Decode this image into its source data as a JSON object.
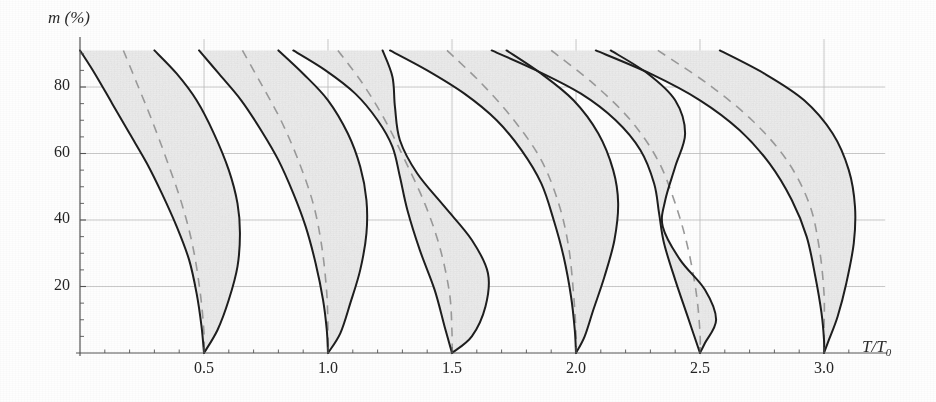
{
  "figure": {
    "caption_y": "m (%)",
    "caption_x": "T/T₀",
    "background": "#fefefe"
  },
  "chart_data": {
    "type": "line",
    "title": "",
    "xlabel": "T/T₀",
    "ylabel": "m (%)",
    "xlim": [
      0,
      3.15
    ],
    "ylim": [
      0,
      92
    ],
    "grid": true,
    "legend": "none",
    "style": {
      "curve_color": "#1e1e1e",
      "curve_width": 2.0,
      "dashed_color": "#9a9a9a",
      "dashed_width": 1.6,
      "fill_color": "#ececec",
      "grid_color": "#b9b9b9",
      "axis_color": "#555555"
    },
    "x_ticks_major": [
      0.5,
      1.0,
      1.5,
      2.0,
      2.5,
      3.0
    ],
    "x_tick_labels": [
      "0.5",
      "1.0",
      "1.5",
      "2.0",
      "2.5",
      "3.0"
    ],
    "x_minor_step": 0.1,
    "y_ticks_major": [
      20,
      40,
      60,
      80
    ],
    "y_tick_labels": [
      "20",
      "40",
      "60",
      "80"
    ],
    "y_minor_step": 5,
    "lobes": [
      {
        "index": 1,
        "apex_x": 0.5,
        "apex_y": 0,
        "top_y": 91,
        "left_top_x": 0.0,
        "right_top_x": 0.3,
        "widest_x": 0.64,
        "widest_y": 42,
        "left_boundary": [
          [
            0.0,
            91
          ],
          [
            0.06,
            84
          ],
          [
            0.13,
            75
          ],
          [
            0.2,
            66
          ],
          [
            0.27,
            57
          ],
          [
            0.33,
            48
          ],
          [
            0.39,
            38
          ],
          [
            0.44,
            28
          ],
          [
            0.47,
            18
          ],
          [
            0.49,
            8
          ],
          [
            0.5,
            0
          ]
        ],
        "right_boundary": [
          [
            0.3,
            91
          ],
          [
            0.39,
            84
          ],
          [
            0.47,
            76
          ],
          [
            0.54,
            66
          ],
          [
            0.6,
            55
          ],
          [
            0.635,
            45
          ],
          [
            0.645,
            36
          ],
          [
            0.635,
            26
          ],
          [
            0.6,
            16
          ],
          [
            0.555,
            7
          ],
          [
            0.5,
            0
          ]
        ],
        "dashed": [
          [
            0.175,
            91
          ],
          [
            0.23,
            81
          ],
          [
            0.29,
            70
          ],
          [
            0.35,
            58
          ],
          [
            0.41,
            45
          ],
          [
            0.455,
            32
          ],
          [
            0.485,
            18
          ],
          [
            0.5,
            6
          ],
          [
            0.5,
            0
          ]
        ]
      },
      {
        "index": 2,
        "apex_x": 1.0,
        "apex_y": 0,
        "top_y": 91,
        "left_top_x": 0.48,
        "right_top_x": 0.8,
        "widest_x": 1.14,
        "widest_y": 48,
        "left_boundary": [
          [
            0.48,
            91
          ],
          [
            0.56,
            84
          ],
          [
            0.65,
            76
          ],
          [
            0.73,
            67
          ],
          [
            0.8,
            58
          ],
          [
            0.86,
            48
          ],
          [
            0.91,
            38
          ],
          [
            0.95,
            27
          ],
          [
            0.98,
            16
          ],
          [
            0.995,
            7
          ],
          [
            1.0,
            0
          ]
        ],
        "right_boundary": [
          [
            0.8,
            91
          ],
          [
            0.9,
            84
          ],
          [
            1.0,
            76
          ],
          [
            1.08,
            66
          ],
          [
            1.13,
            56
          ],
          [
            1.155,
            46
          ],
          [
            1.155,
            36
          ],
          [
            1.13,
            25
          ],
          [
            1.09,
            15
          ],
          [
            1.05,
            6
          ],
          [
            1.0,
            0
          ]
        ],
        "dashed": [
          [
            0.655,
            91
          ],
          [
            0.73,
            81
          ],
          [
            0.81,
            70
          ],
          [
            0.88,
            58
          ],
          [
            0.94,
            45
          ],
          [
            0.975,
            32
          ],
          [
            0.995,
            18
          ],
          [
            1.0,
            6
          ],
          [
            1.0,
            0
          ]
        ]
      },
      {
        "index": 3,
        "apex_x": 1.5,
        "apex_y": 0,
        "top_y": 91,
        "left_top_x": 0.86,
        "right_top_x": 1.22,
        "crossing_x": 1.27,
        "crossing_y": 58,
        "widest_x": 1.64,
        "widest_y": 40,
        "left_boundary": [
          [
            0.86,
            91
          ],
          [
            0.99,
            85
          ],
          [
            1.11,
            78
          ],
          [
            1.2,
            70
          ],
          [
            1.26,
            62
          ],
          [
            1.29,
            53
          ],
          [
            1.32,
            43
          ],
          [
            1.37,
            31
          ],
          [
            1.43,
            19
          ],
          [
            1.47,
            8
          ],
          [
            1.5,
            0
          ]
        ],
        "right_boundary": [
          [
            1.22,
            91
          ],
          [
            1.26,
            83
          ],
          [
            1.27,
            74
          ],
          [
            1.29,
            64
          ],
          [
            1.36,
            54
          ],
          [
            1.47,
            44
          ],
          [
            1.58,
            34
          ],
          [
            1.645,
            24
          ],
          [
            1.635,
            14
          ],
          [
            1.58,
            5
          ],
          [
            1.5,
            0
          ]
        ],
        "dashed": [
          [
            1.04,
            91
          ],
          [
            1.14,
            81
          ],
          [
            1.23,
            70
          ],
          [
            1.31,
            58
          ],
          [
            1.39,
            45
          ],
          [
            1.45,
            32
          ],
          [
            1.49,
            18
          ],
          [
            1.5,
            6
          ],
          [
            1.5,
            0
          ]
        ]
      },
      {
        "index": 4,
        "apex_x": 2.0,
        "apex_y": 0,
        "top_y": 91,
        "left_top_x": 1.25,
        "right_top_x": 1.72,
        "widest_x": 2.16,
        "widest_y": 45,
        "left_boundary": [
          [
            1.25,
            91
          ],
          [
            1.4,
            85
          ],
          [
            1.55,
            78
          ],
          [
            1.68,
            70
          ],
          [
            1.78,
            61
          ],
          [
            1.86,
            51
          ],
          [
            1.91,
            40
          ],
          [
            1.95,
            29
          ],
          [
            1.98,
            17
          ],
          [
            1.995,
            7
          ],
          [
            2.0,
            0
          ]
        ],
        "right_boundary": [
          [
            1.72,
            91
          ],
          [
            1.86,
            84
          ],
          [
            1.99,
            76
          ],
          [
            2.09,
            66
          ],
          [
            2.15,
            55
          ],
          [
            2.17,
            45
          ],
          [
            2.155,
            34
          ],
          [
            2.115,
            23
          ],
          [
            2.07,
            13
          ],
          [
            2.035,
            5
          ],
          [
            2.0,
            0
          ]
        ],
        "dashed": [
          [
            1.48,
            91
          ],
          [
            1.62,
            81
          ],
          [
            1.75,
            70
          ],
          [
            1.86,
            58
          ],
          [
            1.93,
            45
          ],
          [
            1.97,
            32
          ],
          [
            1.99,
            18
          ],
          [
            2.0,
            6
          ],
          [
            2.0,
            0
          ]
        ]
      },
      {
        "index": 5,
        "apex_x": 2.5,
        "apex_y": 0,
        "top_y": 91,
        "left_top_x": 1.66,
        "right_top_x": 2.14,
        "crossing_x": 2.335,
        "crossing_y": 39,
        "widest_x": 2.62,
        "widest_y": 22,
        "left_boundary": [
          [
            1.66,
            91
          ],
          [
            1.84,
            85
          ],
          [
            2.02,
            78
          ],
          [
            2.16,
            70
          ],
          [
            2.26,
            61
          ],
          [
            2.315,
            51
          ],
          [
            2.335,
            42
          ],
          [
            2.355,
            33
          ],
          [
            2.4,
            22
          ],
          [
            2.45,
            11
          ],
          [
            2.5,
            0
          ]
        ],
        "right_boundary": [
          [
            2.14,
            91
          ],
          [
            2.29,
            84
          ],
          [
            2.4,
            76
          ],
          [
            2.44,
            66
          ],
          [
            2.4,
            56
          ],
          [
            2.36,
            46
          ],
          [
            2.35,
            38
          ],
          [
            2.42,
            28
          ],
          [
            2.52,
            19
          ],
          [
            2.565,
            10
          ],
          [
            2.52,
            3
          ],
          [
            2.5,
            0
          ]
        ],
        "dashed": [
          [
            1.9,
            91
          ],
          [
            2.07,
            81
          ],
          [
            2.22,
            70
          ],
          [
            2.33,
            58
          ],
          [
            2.4,
            45
          ],
          [
            2.45,
            32
          ],
          [
            2.485,
            18
          ],
          [
            2.5,
            6
          ],
          [
            2.5,
            0
          ]
        ]
      },
      {
        "index": 6,
        "apex_x": 3.0,
        "apex_y": 0,
        "top_y": 91,
        "left_top_x": 2.08,
        "right_top_x": 2.58,
        "widest_x": 3.12,
        "widest_y": 28,
        "left_boundary": [
          [
            2.08,
            91
          ],
          [
            2.3,
            84
          ],
          [
            2.5,
            76
          ],
          [
            2.66,
            67
          ],
          [
            2.78,
            57
          ],
          [
            2.87,
            46
          ],
          [
            2.93,
            35
          ],
          [
            2.965,
            23
          ],
          [
            2.99,
            12
          ],
          [
            3.0,
            4
          ],
          [
            3.0,
            0
          ]
        ],
        "right_boundary": [
          [
            2.58,
            91
          ],
          [
            2.76,
            84
          ],
          [
            2.92,
            76
          ],
          [
            3.035,
            66
          ],
          [
            3.1,
            55
          ],
          [
            3.125,
            44
          ],
          [
            3.12,
            33
          ],
          [
            3.09,
            21
          ],
          [
            3.055,
            11
          ],
          [
            3.02,
            4
          ],
          [
            3.0,
            0
          ]
        ],
        "dashed": [
          [
            2.33,
            91
          ],
          [
            2.53,
            81
          ],
          [
            2.71,
            70
          ],
          [
            2.85,
            58
          ],
          [
            2.94,
            45
          ],
          [
            2.98,
            32
          ],
          [
            3.0,
            18
          ],
          [
            3.0,
            6
          ],
          [
            3.0,
            0
          ]
        ]
      }
    ]
  }
}
